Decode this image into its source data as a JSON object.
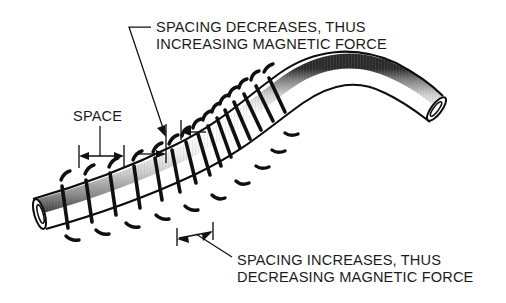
{
  "figure": {
    "type": "technical-illustration",
    "background_color": "#ffffff",
    "ink_color": "#111111"
  },
  "annotations": {
    "top": {
      "line1": "SPACING DECREASES, THUS",
      "line2": "INCREASING MAGNETIC FORCE",
      "points_to": "inside-of-bend-compressed-coils"
    },
    "bottom": {
      "line1": "SPACING INCREASES, THUS",
      "line2": "DECREASING MAGNETIC FORCE",
      "points_to": "outside-of-bend-expanded-coils"
    },
    "space": {
      "label": "SPACE",
      "points_to": "baseline-coil-gap-dimension"
    }
  },
  "dimensions": {
    "reference_space": {
      "name": "SPACE",
      "style": "double-headed-arrow-between-ticks",
      "relative_width": "nominal"
    },
    "compressed_space": {
      "name": "decreased-spacing",
      "style": "inward-pointing-arrows",
      "relative_width": "narrow"
    },
    "expanded_space": {
      "name": "increased-spacing",
      "style": "outward-pointing-arrows",
      "relative_width": "wide"
    }
  },
  "tube": {
    "fill_highlight": "#ffffff",
    "fill_shadow": "#8d8d8d",
    "outline_color": "#0d0d0d",
    "end_caps": [
      "left-open-ellipse",
      "right-open-ellipse"
    ],
    "coil_marks_count": 44
  }
}
